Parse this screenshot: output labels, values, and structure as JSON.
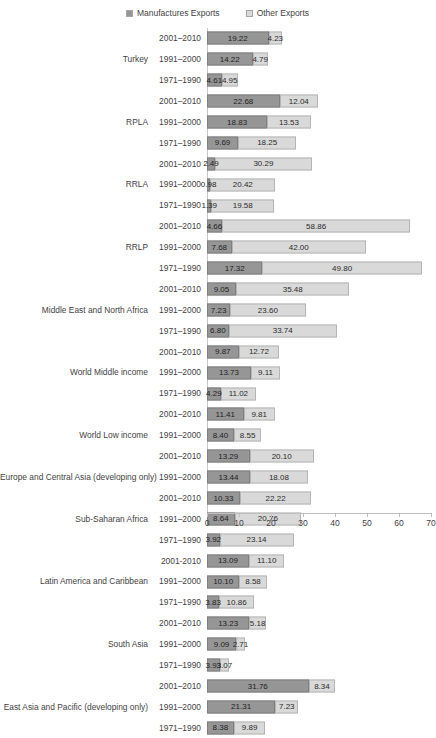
{
  "legend": {
    "entries": [
      {
        "label": "Manufactures Exports",
        "color": "#969696",
        "icon": "legend-swatch-manufactures"
      },
      {
        "label": "Other Exports",
        "color": "#d9d9d9",
        "icon": "legend-swatch-other"
      }
    ]
  },
  "axis": {
    "ticks": [
      "0",
      "10",
      "20",
      "30",
      "40",
      "50",
      "60",
      "70"
    ],
    "min": 0,
    "max": 70,
    "step": 10
  },
  "chart_data": {
    "type": "bar",
    "orientation": "horizontal",
    "stacked": true,
    "title": "",
    "subtitle": "",
    "xlabel": "",
    "ylabel": "",
    "xlim": [
      0,
      70
    ],
    "xticks": [
      0,
      10,
      20,
      30,
      40,
      50,
      60,
      70
    ],
    "grid": false,
    "legend_position": "top-center",
    "series": [
      {
        "name": "Manufactures Exports",
        "color": "#969696"
      },
      {
        "name": "Other Exports",
        "color": "#d9d9d9"
      }
    ],
    "groups": [
      {
        "name": "Turkey",
        "rows": [
          {
            "period": "2001–2010",
            "manufactures": 19.22,
            "other": 4.23
          },
          {
            "period": "1991–2000",
            "manufactures": 14.22,
            "other": 4.79
          },
          {
            "period": "1971–1990",
            "manufactures": 4.61,
            "other": 4.95
          }
        ]
      },
      {
        "name": "RPLA",
        "rows": [
          {
            "period": "2001–2010",
            "manufactures": 22.68,
            "other": 12.04
          },
          {
            "period": "1991–2000",
            "manufactures": 18.83,
            "other": 13.53
          },
          {
            "period": "1971–1990",
            "manufactures": 9.69,
            "other": 18.25
          }
        ]
      },
      {
        "name": "RRLA",
        "rows": [
          {
            "period": "2001–2010",
            "manufactures": 2.49,
            "other": 30.29
          },
          {
            "period": "1991–2000",
            "manufactures": 0.98,
            "other": 20.42
          },
          {
            "period": "1971–1990",
            "manufactures": 1.39,
            "other": 19.58
          }
        ]
      },
      {
        "name": "RRLP",
        "rows": [
          {
            "period": "2001–2010",
            "manufactures": 4.66,
            "other": 58.86
          },
          {
            "period": "1991–2000",
            "manufactures": 7.68,
            "other": 42.0
          },
          {
            "period": "1971–1990",
            "manufactures": 17.32,
            "other": 49.8
          }
        ]
      },
      {
        "name": "Middle East and North Africa",
        "rows": [
          {
            "period": "2001–2010",
            "manufactures": 9.05,
            "other": 35.48
          },
          {
            "period": "1991–2000",
            "manufactures": 7.23,
            "other": 23.6
          },
          {
            "period": "1971–1990",
            "manufactures": 6.8,
            "other": 33.74
          }
        ]
      },
      {
        "name": "World Middle income",
        "rows": [
          {
            "period": "2001–2010",
            "manufactures": 9.87,
            "other": 12.72
          },
          {
            "period": "1991–2000",
            "manufactures": 13.73,
            "other": 9.11
          },
          {
            "period": "1971–1990",
            "manufactures": 4.29,
            "other": 11.02
          }
        ]
      },
      {
        "name": "World Low income",
        "rows": [
          {
            "period": "2001–2010",
            "manufactures": 11.41,
            "other": 9.81
          },
          {
            "period": "1991–2000",
            "manufactures": 8.4,
            "other": 8.55
          }
        ]
      },
      {
        "name": "Europe and Central Asia (developing only)",
        "rows": [
          {
            "period": "2001–2010",
            "manufactures": 13.29,
            "other": 20.1
          },
          {
            "period": "1991–2000",
            "manufactures": 13.44,
            "other": 18.08
          }
        ]
      },
      {
        "name": "Sub-Saharan Africa",
        "rows": [
          {
            "period": "2001–2010",
            "manufactures": 10.33,
            "other": 22.22
          },
          {
            "period": "1991–2000",
            "manufactures": 8.64,
            "other": 20.76
          },
          {
            "period": "1971–1990",
            "manufactures": 3.92,
            "other": 23.14
          }
        ]
      },
      {
        "name": "Latin America and Caribbean",
        "rows": [
          {
            "period": "2001-2010",
            "manufactures": 13.09,
            "other": 11.1
          },
          {
            "period": "1991–2000",
            "manufactures": 10.1,
            "other": 8.58
          },
          {
            "period": "1971–1990",
            "manufactures": 3.83,
            "other": 10.86
          }
        ]
      },
      {
        "name": "South Asia",
        "rows": [
          {
            "period": "2001–2010",
            "manufactures": 13.23,
            "other": 5.18
          },
          {
            "period": "1991–2000",
            "manufactures": 9.09,
            "other": 2.71
          },
          {
            "period": "1971–1990",
            "manufactures": 3.93,
            "other": 3.07
          }
        ]
      },
      {
        "name": "East Asia and Pacific (developing only)",
        "rows": [
          {
            "period": "2001–2010",
            "manufactures": 31.76,
            "other": 8.34
          },
          {
            "period": "1991–2000",
            "manufactures": 21.31,
            "other": 7.23
          },
          {
            "period": "1971–1990",
            "manufactures": 8.38,
            "other": 9.89
          }
        ]
      }
    ]
  }
}
